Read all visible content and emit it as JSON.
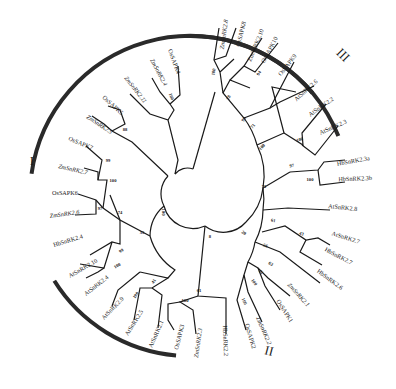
{
  "figure": {
    "type": "circular-phylogenetic-tree",
    "center": [
      190,
      196
    ],
    "clades": [
      {
        "label": "I",
        "pos": [
          32,
          165
        ],
        "rot": 0,
        "arc": {
          "r": 160,
          "start": 188,
          "end": 320
        }
      },
      {
        "label": "II",
        "pos": [
          268,
          355
        ],
        "rot": 15,
        "arc": {
          "r": 160,
          "start": 95,
          "end": 148
        }
      },
      {
        "label": "III",
        "pos": [
          340,
          58
        ],
        "rot": 45,
        "arc": {
          "r": 160,
          "start": 268,
          "end": 338
        }
      }
    ],
    "leaves": [
      {
        "name": "ZmSnRK2.8",
        "x": 228,
        "y": 20,
        "rot": -82,
        "anchor": "end",
        "italic": true
      },
      {
        "name": "OsSAPK8",
        "x": 246,
        "y": 22,
        "rot": -76,
        "anchor": "end"
      },
      {
        "name": "ZmSnRK2.10",
        "x": 264,
        "y": 30,
        "rot": -68,
        "anchor": "end"
      },
      {
        "name": "OsSAPK10",
        "x": 278,
        "y": 38,
        "rot": -62,
        "anchor": "end"
      },
      {
        "name": "OsSAPK9",
        "x": 297,
        "y": 56,
        "rot": -52,
        "anchor": "end"
      },
      {
        "name": "AtSnRK2.6",
        "x": 318,
        "y": 82,
        "rot": -42,
        "anchor": "end"
      },
      {
        "name": "AtSnRK2.2",
        "x": 334,
        "y": 100,
        "rot": -35,
        "anchor": "end"
      },
      {
        "name": "AtSnRK2.3",
        "x": 347,
        "y": 123,
        "rot": -24,
        "anchor": "end"
      },
      {
        "name": "HbSnRK2.3a",
        "x": 370,
        "y": 160,
        "rot": -10,
        "anchor": "end"
      },
      {
        "name": "HbSnRK2.3b",
        "x": 372,
        "y": 180,
        "rot": -2,
        "anchor": "end"
      },
      {
        "name": "AtSnRK2.8",
        "x": 357,
        "y": 211,
        "rot": 6,
        "anchor": "end"
      },
      {
        "name": "AtSnRK2.7",
        "x": 359,
        "y": 244,
        "rot": 18,
        "anchor": "end"
      },
      {
        "name": "HbSnRK2.7",
        "x": 351,
        "y": 265,
        "rot": 28,
        "anchor": "end"
      },
      {
        "name": "HbSnRK2.6",
        "x": 341,
        "y": 290,
        "rot": 36,
        "anchor": "end"
      },
      {
        "name": "ZmSnRK2.1",
        "x": 307,
        "y": 307,
        "rot": 48,
        "anchor": "end",
        "italic": true
      },
      {
        "name": "OsSAPK1",
        "x": 290,
        "y": 323,
        "rot": 58,
        "anchor": "end"
      },
      {
        "name": "ZmSnRK2.2",
        "x": 268,
        "y": 345,
        "rot": 66,
        "anchor": "end",
        "italic": true
      },
      {
        "name": "OsSAPK2",
        "x": 252,
        "y": 349,
        "rot": 74,
        "anchor": "end"
      },
      {
        "name": "HbSnRK2.2",
        "x": 224,
        "y": 356,
        "rot": 88,
        "anchor": "end"
      },
      {
        "name": "ZmSnRK2.3",
        "x": 198,
        "y": 358,
        "rot": 98,
        "anchor": "end",
        "italic": true
      },
      {
        "name": "OsSAPK3",
        "x": 178,
        "y": 350,
        "rot": 104,
        "anchor": "end"
      },
      {
        "name": "AtSnRK2.1",
        "x": 152,
        "y": 348,
        "rot": 114,
        "anchor": "end"
      },
      {
        "name": "AtSnRK2.5",
        "x": 128,
        "y": 336,
        "rot": 122,
        "anchor": "end"
      },
      {
        "name": "AtSnRK2.9",
        "x": 104,
        "y": 320,
        "rot": 134,
        "anchor": "end"
      },
      {
        "name": "AtSnRK2.4",
        "x": 86,
        "y": 296,
        "rot": 142,
        "anchor": "end"
      },
      {
        "name": "AtSnRK2.10",
        "x": 70,
        "y": 278,
        "rot": 150,
        "anchor": "end"
      },
      {
        "name": "HbSnRK2.4",
        "x": 54,
        "y": 247,
        "rot": 163,
        "anchor": "end"
      },
      {
        "name": "ZmSnRK2.6",
        "x": 50,
        "y": 218,
        "rot": 172,
        "anchor": "end",
        "italic": true
      },
      {
        "name": "OsSAPK6",
        "x": 52,
        "y": 195,
        "rot": 180,
        "anchor": "end"
      },
      {
        "name": "ZmSnRK2.7",
        "x": 58,
        "y": 168,
        "rot": 193,
        "anchor": "end",
        "italic": true
      },
      {
        "name": "OsSAPK7",
        "x": 68,
        "y": 140,
        "rot": 203,
        "anchor": "end"
      },
      {
        "name": "ZmSnRK2.5",
        "x": 86,
        "y": 118,
        "rot": 213,
        "anchor": "end",
        "italic": true
      },
      {
        "name": "OsSAPK5",
        "x": 102,
        "y": 98,
        "rot": 222,
        "anchor": "end"
      },
      {
        "name": "ZmSnRK2.11",
        "x": 124,
        "y": 78,
        "rot": 232,
        "anchor": "end",
        "italic": true
      },
      {
        "name": "ZmSnRK2.4",
        "x": 150,
        "y": 60,
        "rot": 242,
        "anchor": "end",
        "italic": true
      },
      {
        "name": "OsSAPK4",
        "x": 168,
        "y": 50,
        "rot": 250,
        "anchor": "end"
      }
    ],
    "bootstrap": [
      {
        "value": "100",
        "x": 215,
        "y": 72,
        "rot": -80
      },
      {
        "value": "78",
        "x": 230,
        "y": 98,
        "rot": -70
      },
      {
        "value": "94",
        "x": 260,
        "y": 74,
        "rot": -55
      },
      {
        "value": "98",
        "x": 245,
        "y": 120,
        "rot": -60
      },
      {
        "value": "71",
        "x": 254,
        "y": 127,
        "rot": -50
      },
      {
        "value": "100",
        "x": 263,
        "y": 148,
        "rot": -45
      },
      {
        "value": "100",
        "x": 300,
        "y": 141,
        "rot": -15
      },
      {
        "value": "97",
        "x": 292,
        "y": 167,
        "rot": -10
      },
      {
        "value": "100",
        "x": 310,
        "y": 181,
        "rot": 0
      },
      {
        "value": "71",
        "x": 264,
        "y": 188,
        "rot": 0
      },
      {
        "value": "61",
        "x": 273,
        "y": 222,
        "rot": 10
      },
      {
        "value": "43",
        "x": 301,
        "y": 235,
        "rot": 20
      },
      {
        "value": "56",
        "x": 265,
        "y": 247,
        "rot": 20
      },
      {
        "value": "63",
        "x": 270,
        "y": 265,
        "rot": 35
      },
      {
        "value": "61",
        "x": 260,
        "y": 273,
        "rot": 45
      },
      {
        "value": "100",
        "x": 253,
        "y": 283,
        "rot": 55
      },
      {
        "value": "100",
        "x": 243,
        "y": 302,
        "rot": 65
      },
      {
        "value": "20",
        "x": 243,
        "y": 234,
        "rot": 35
      },
      {
        "value": "8",
        "x": 210,
        "y": 238,
        "rot": 0
      },
      {
        "value": "61",
        "x": 199,
        "y": 292,
        "rot": 0
      },
      {
        "value": "100",
        "x": 185,
        "y": 302,
        "rot": 0
      },
      {
        "value": "100",
        "x": 162,
        "y": 212,
        "rot": 90
      },
      {
        "value": "35",
        "x": 142,
        "y": 234,
        "rot": 0
      },
      {
        "value": "41",
        "x": 155,
        "y": 282,
        "rot": 120
      },
      {
        "value": "100",
        "x": 137,
        "y": 296,
        "rot": 125
      },
      {
        "value": "74",
        "x": 120,
        "y": 214,
        "rot": 0
      },
      {
        "value": "97",
        "x": 100,
        "y": 210,
        "rot": 0
      },
      {
        "value": "99",
        "x": 122,
        "y": 252,
        "rot": 150
      },
      {
        "value": "100",
        "x": 118,
        "y": 267,
        "rot": 150
      },
      {
        "value": "99",
        "x": 108,
        "y": 162,
        "rot": 0
      },
      {
        "value": "100",
        "x": 113,
        "y": 182,
        "rot": 0
      },
      {
        "value": "88",
        "x": 125,
        "y": 131,
        "rot": 0
      },
      {
        "value": "100",
        "x": 170,
        "y": 97,
        "rot": 250
      }
    ]
  }
}
